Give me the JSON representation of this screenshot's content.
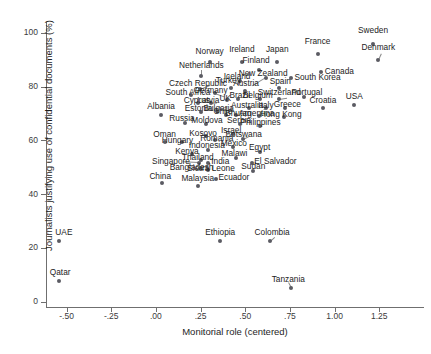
{
  "chart_data": {
    "type": "scatter",
    "title": "",
    "xlabel": "Monitorial role (centered)",
    "ylabel": "Journalists justifying use of confidential documents (%)",
    "xlim": [
      -0.615,
      1.5
    ],
    "ylim": [
      -2.0,
      104.0
    ],
    "xticks": [
      -0.5,
      -0.25,
      0.0,
      0.25,
      0.5,
      0.75,
      1.0,
      1.25
    ],
    "xticklabels": [
      "-.50",
      "-.25",
      ".00",
      ".25",
      ".50",
      ".75",
      "1.00",
      "1.25"
    ],
    "yticks": [
      0,
      20,
      40,
      60,
      80,
      100
    ],
    "yticklabels": [
      "0",
      "20",
      "40",
      "60",
      "80",
      "100"
    ],
    "grid": false,
    "legend": false,
    "marker_color": "#5b5b63",
    "axis_color": "#6f6f6f",
    "points": [
      {
        "label": "Sweden",
        "x": 1.215,
        "y": 96.0,
        "lx": 1.215,
        "ly": 100.5,
        "anchor": "center"
      },
      {
        "label": "Denmark",
        "x": 1.245,
        "y": 90.0,
        "lx": 1.245,
        "ly": 94.5,
        "anchor": "center"
      },
      {
        "label": "France",
        "x": 0.905,
        "y": 92.0,
        "lx": 0.905,
        "ly": 96.5,
        "anchor": "center"
      },
      {
        "label": "Canada",
        "x": 0.925,
        "y": 85.5,
        "lx": 0.945,
        "ly": 85.5,
        "anchor": "left"
      },
      {
        "label": "Japan",
        "x": 0.68,
        "y": 89.0,
        "lx": 0.68,
        "ly": 93.5,
        "anchor": "center"
      },
      {
        "label": "Ireland",
        "x": 0.48,
        "y": 89.0,
        "lx": 0.48,
        "ly": 93.5,
        "anchor": "center"
      },
      {
        "label": "Norway",
        "x": 0.3,
        "y": 89.0,
        "lx": 0.3,
        "ly": 93.0,
        "anchor": "center"
      },
      {
        "label": "Finland",
        "x": 0.575,
        "y": 86.0,
        "lx": 0.56,
        "ly": 89.5,
        "anchor": "center"
      },
      {
        "label": "South Korea",
        "x": 0.755,
        "y": 83.0,
        "lx": 0.775,
        "ly": 83.0,
        "anchor": "left"
      },
      {
        "label": "New Zealand",
        "x": 0.615,
        "y": 83.0,
        "lx": 0.6,
        "ly": 84.5,
        "anchor": "center"
      },
      {
        "label": "Iceland",
        "x": 0.47,
        "y": 82.0,
        "lx": 0.455,
        "ly": 83.5,
        "anchor": "center"
      },
      {
        "label": "Netherlands",
        "x": 0.255,
        "y": 84.0,
        "lx": 0.255,
        "ly": 87.5,
        "anchor": "center"
      },
      {
        "label": "Spain",
        "x": 0.69,
        "y": 79.5,
        "lx": 0.695,
        "ly": 81.5,
        "anchor": "center"
      },
      {
        "label": "Turkey",
        "x": 0.42,
        "y": 79.5,
        "lx": 0.405,
        "ly": 82.0,
        "anchor": "center"
      },
      {
        "label": "Austria",
        "x": 0.5,
        "y": 78.5,
        "lx": 0.505,
        "ly": 81.0,
        "anchor": "center"
      },
      {
        "label": "Czech Republic",
        "x": 0.245,
        "y": 79.0,
        "lx": 0.235,
        "ly": 81.0,
        "anchor": "center"
      },
      {
        "label": "Switzerland",
        "x": 0.69,
        "y": 75.5,
        "lx": 0.69,
        "ly": 77.5,
        "anchor": "center"
      },
      {
        "label": "Portugal",
        "x": 0.83,
        "y": 76.0,
        "lx": 0.845,
        "ly": 77.5,
        "anchor": "center"
      },
      {
        "label": "Belgium",
        "x": 0.585,
        "y": 75.5,
        "lx": 0.57,
        "ly": 76.5,
        "anchor": "center"
      },
      {
        "label": "Brazil",
        "x": 0.46,
        "y": 75.5,
        "lx": 0.47,
        "ly": 76.5,
        "anchor": "center"
      },
      {
        "label": "Germany",
        "x": 0.33,
        "y": 77.5,
        "lx": 0.305,
        "ly": 78.5,
        "anchor": "center"
      },
      {
        "label": "South Africa",
        "x": 0.195,
        "y": 77.0,
        "lx": 0.18,
        "ly": 77.5,
        "anchor": "center"
      },
      {
        "label": "UK",
        "x": 0.395,
        "y": 75.0,
        "lx": 0.39,
        "ly": 75.5,
        "anchor": "center"
      },
      {
        "label": "Croatia",
        "x": 0.935,
        "y": 72.0,
        "lx": 0.935,
        "ly": 74.5,
        "anchor": "center"
      },
      {
        "label": "USA",
        "x": 1.11,
        "y": 73.0,
        "lx": 1.11,
        "ly": 76.0,
        "anchor": "center"
      },
      {
        "label": "Greece",
        "x": 0.72,
        "y": 72.0,
        "lx": 0.735,
        "ly": 73.0,
        "anchor": "center"
      },
      {
        "label": "Italy",
        "x": 0.615,
        "y": 72.0,
        "lx": 0.615,
        "ly": 72.8,
        "anchor": "center"
      },
      {
        "label": "Australia",
        "x": 0.52,
        "y": 72.0,
        "lx": 0.51,
        "ly": 72.8,
        "anchor": "center"
      },
      {
        "label": "Latvia",
        "x": 0.31,
        "y": 74.0,
        "lx": 0.293,
        "ly": 74.5,
        "anchor": "center"
      },
      {
        "label": "Cyprus",
        "x": 0.235,
        "y": 74.0,
        "lx": 0.228,
        "ly": 74.5,
        "anchor": "center"
      },
      {
        "label": "Bulgaria",
        "x": 0.34,
        "y": 71.0,
        "lx": 0.35,
        "ly": 71.5,
        "anchor": "center"
      },
      {
        "label": "Hong Kong",
        "x": 0.715,
        "y": 68.5,
        "lx": 0.7,
        "ly": 69.5,
        "anchor": "center"
      },
      {
        "label": "Argentina",
        "x": 0.575,
        "y": 69.0,
        "lx": 0.565,
        "ly": 69.8,
        "anchor": "center"
      },
      {
        "label": "Chile",
        "x": 0.39,
        "y": 69.5,
        "lx": 0.375,
        "ly": 70.5,
        "anchor": "center"
      },
      {
        "label": "Bhutan",
        "x": 0.45,
        "y": 69.5,
        "lx": 0.46,
        "ly": 69.8,
        "anchor": "center"
      },
      {
        "label": "Estonia",
        "x": 0.255,
        "y": 70.5,
        "lx": 0.24,
        "ly": 71.5,
        "anchor": "center"
      },
      {
        "label": "Albania",
        "x": 0.03,
        "y": 69.5,
        "lx": 0.03,
        "ly": 72.5,
        "anchor": "center"
      },
      {
        "label": "Philippines",
        "x": 0.585,
        "y": 65.5,
        "lx": 0.585,
        "ly": 66.5,
        "anchor": "center"
      },
      {
        "label": "Serbia",
        "x": 0.47,
        "y": 66.0,
        "lx": 0.465,
        "ly": 67.0,
        "anchor": "center"
      },
      {
        "label": "Israel",
        "x": 0.43,
        "y": 62.5,
        "lx": 0.42,
        "ly": 63.5,
        "anchor": "center"
      },
      {
        "label": "Moldova",
        "x": 0.28,
        "y": 66.0,
        "lx": 0.285,
        "ly": 67.0,
        "anchor": "center"
      },
      {
        "label": "Russia",
        "x": 0.16,
        "y": 66.5,
        "lx": 0.145,
        "ly": 68.0,
        "anchor": "center"
      },
      {
        "label": "Botswana",
        "x": 0.49,
        "y": 60.5,
        "lx": 0.49,
        "ly": 62.0,
        "anchor": "center"
      },
      {
        "label": "Kosovo",
        "x": 0.28,
        "y": 61.5,
        "lx": 0.265,
        "ly": 62.5,
        "anchor": "center"
      },
      {
        "label": "Romania",
        "x": 0.33,
        "y": 60.0,
        "lx": 0.34,
        "ly": 60.5,
        "anchor": "center"
      },
      {
        "label": "Mexico",
        "x": 0.43,
        "y": 57.5,
        "lx": 0.435,
        "ly": 58.5,
        "anchor": "center"
      },
      {
        "label": "Oman",
        "x": 0.05,
        "y": 59.5,
        "lx": 0.05,
        "ly": 62.0,
        "anchor": "center"
      },
      {
        "label": "Hungary",
        "x": 0.145,
        "y": 59.5,
        "lx": 0.12,
        "ly": 59.8,
        "anchor": "center"
      },
      {
        "label": "Indonesia",
        "x": 0.29,
        "y": 56.5,
        "lx": 0.285,
        "ly": 58.0,
        "anchor": "center"
      },
      {
        "label": "Egypt",
        "x": 0.58,
        "y": 55.5,
        "lx": 0.58,
        "ly": 57.0,
        "anchor": "center"
      },
      {
        "label": "Malawi",
        "x": 0.45,
        "y": 53.5,
        "lx": 0.44,
        "ly": 55.0,
        "anchor": "center"
      },
      {
        "label": "Kenya",
        "x": 0.2,
        "y": 55.0,
        "lx": 0.175,
        "ly": 55.5,
        "anchor": "center"
      },
      {
        "label": "Thailand",
        "x": 0.25,
        "y": 52.5,
        "lx": 0.235,
        "ly": 53.5,
        "anchor": "center"
      },
      {
        "label": "India",
        "x": 0.29,
        "y": 51.5,
        "lx": 0.31,
        "ly": 51.8,
        "anchor": "left"
      },
      {
        "label": "El Salvador",
        "x": 0.535,
        "y": 51.5,
        "lx": 0.55,
        "ly": 51.8,
        "anchor": "left"
      },
      {
        "label": "Singapore",
        "x": 0.24,
        "y": 51.5,
        "lx": 0.085,
        "ly": 52.0,
        "anchor": "center"
      },
      {
        "label": "Sudan",
        "x": 0.545,
        "y": 48.5,
        "lx": 0.545,
        "ly": 50.0,
        "anchor": "center"
      },
      {
        "label": "Sierra Leone",
        "x": 0.29,
        "y": 49.0,
        "lx": 0.31,
        "ly": 49.5,
        "anchor": "center"
      },
      {
        "label": "Bangladesh",
        "x": 0.255,
        "y": 49.5,
        "lx": 0.2,
        "ly": 49.8,
        "anchor": "center"
      },
      {
        "label": "Ecuador",
        "x": 0.335,
        "y": 45.5,
        "lx": 0.35,
        "ly": 45.8,
        "anchor": "left"
      },
      {
        "label": "Malaysia",
        "x": 0.235,
        "y": 43.0,
        "lx": 0.235,
        "ly": 45.5,
        "anchor": "center"
      },
      {
        "label": "China",
        "x": 0.035,
        "y": 44.0,
        "lx": 0.025,
        "ly": 46.5,
        "anchor": "center"
      },
      {
        "label": "Colombia",
        "x": 0.64,
        "y": 22.5,
        "lx": 0.65,
        "ly": 25.5,
        "anchor": "center"
      },
      {
        "label": "Ethiopia",
        "x": 0.36,
        "y": 22.5,
        "lx": 0.36,
        "ly": 25.5,
        "anchor": "center"
      },
      {
        "label": "UAE",
        "x": -0.54,
        "y": 22.5,
        "lx": -0.515,
        "ly": 25.5,
        "anchor": "center"
      },
      {
        "label": "Qatar",
        "x": -0.545,
        "y": 7.5,
        "lx": -0.535,
        "ly": 10.5,
        "anchor": "center"
      },
      {
        "label": "Tanzania",
        "x": 0.755,
        "y": 5.0,
        "lx": 0.74,
        "ly": 8.0,
        "anchor": "center"
      }
    ],
    "leaders": [
      {
        "from": [
          0.255,
          84.0
        ],
        "to": [
          0.255,
          86.3
        ]
      },
      {
        "from": [
          0.245,
          79.0
        ],
        "to": [
          0.3,
          80.5
        ]
      },
      {
        "from": [
          0.615,
          83.0
        ],
        "to": [
          0.54,
          80.0
        ]
      },
      {
        "from": [
          0.31,
          74.0
        ],
        "to": [
          0.345,
          74.2
        ]
      },
      {
        "from": [
          0.33,
          77.5
        ],
        "to": [
          0.38,
          76.3
        ]
      },
      {
        "from": [
          0.69,
          75.5
        ],
        "to": [
          0.735,
          76.0
        ]
      },
      {
        "from": [
          0.24,
          51.5
        ],
        "to": [
          0.15,
          51.8
        ]
      },
      {
        "from": [
          0.64,
          22.5
        ],
        "to": [
          0.665,
          24.0
        ]
      },
      {
        "from": [
          1.245,
          90.0
        ],
        "to": [
          1.262,
          92.5
        ]
      },
      {
        "from": [
          0.49,
          60.5
        ],
        "to": [
          0.52,
          61.5
        ]
      },
      {
        "from": [
          0.755,
          5.0
        ],
        "to": [
          0.74,
          6.8
        ]
      }
    ]
  }
}
